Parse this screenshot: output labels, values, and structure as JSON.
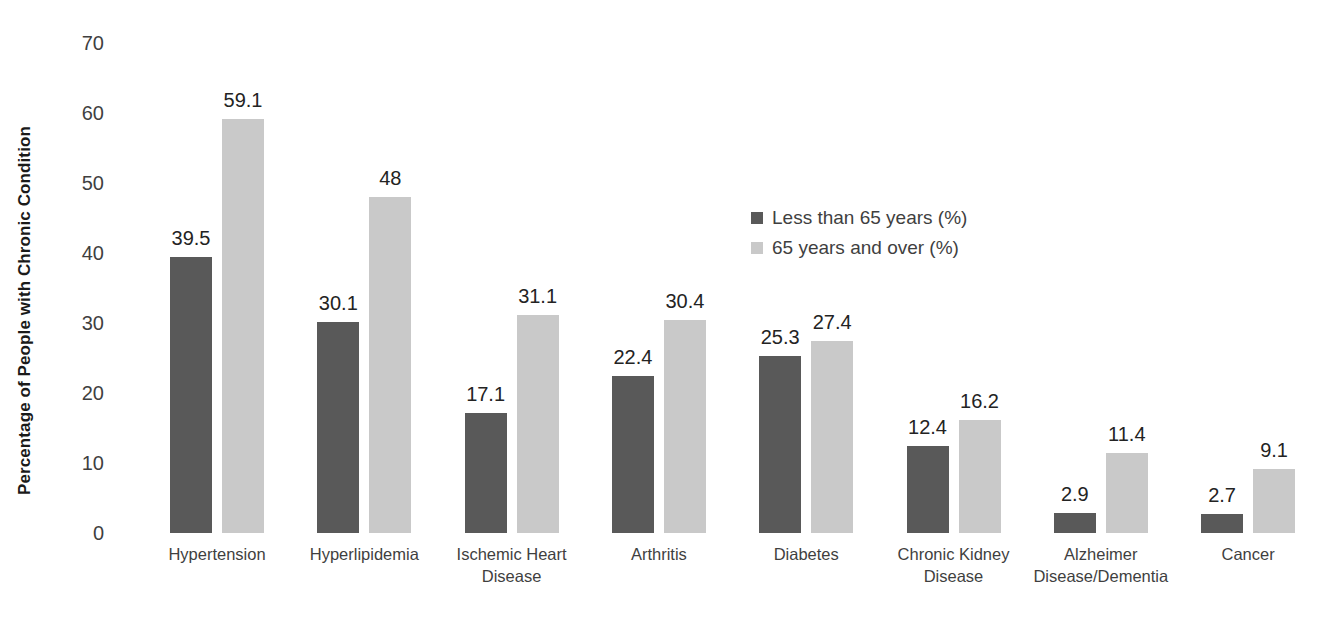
{
  "chart_data": {
    "type": "bar",
    "title": "",
    "subtitle": "",
    "xlabel": "",
    "ylabel": "Percentage of People with Chronic Condition",
    "ylim": [
      0,
      70
    ],
    "ytick_step": 10,
    "yticks": [
      "70",
      "60",
      "50",
      "40",
      "30",
      "20",
      "10",
      "0"
    ],
    "grid": false,
    "legend_position": "center-right",
    "categories": [
      "Hypertension",
      "Hyperlipidemia",
      "Ischemic Heart Disease",
      "Arthritis",
      "Diabetes",
      "Chronic Kidney Disease",
      "Alzheimer Disease/Dementia",
      "Cancer"
    ],
    "category_lines": [
      [
        "Hypertension"
      ],
      [
        "Hyperlipidemia"
      ],
      [
        "Ischemic Heart",
        "Disease"
      ],
      [
        "Arthritis"
      ],
      [
        "Diabetes"
      ],
      [
        "Chronic Kidney",
        "Disease"
      ],
      [
        "Alzheimer",
        "Disease/Dementia"
      ],
      [
        "Cancer"
      ]
    ],
    "series": [
      {
        "name": "Less than 65 years (%)",
        "color": "#595959",
        "values": [
          39.5,
          30.1,
          17.1,
          22.4,
          25.3,
          12.4,
          2.9,
          2.7
        ],
        "labels": [
          "39.5",
          "30.1",
          "17.1",
          "22.4",
          "25.3",
          "12.4",
          "2.9",
          "2.7"
        ]
      },
      {
        "name": "65 years and over (%)",
        "color": "#c9c9c9",
        "values": [
          59.1,
          48,
          31.1,
          30.4,
          27.4,
          16.2,
          11.4,
          9.1
        ],
        "labels": [
          "59.1",
          "48",
          "31.1",
          "30.4",
          "27.4",
          "16.2",
          "11.4",
          "9.1"
        ]
      }
    ]
  },
  "legend": {
    "items": [
      {
        "label": "Less than 65 years (%)",
        "color": "#595959"
      },
      {
        "label": "65 years and over (%)",
        "color": "#c9c9c9"
      }
    ]
  },
  "colors": {
    "background": "#ffffff",
    "series_dark": "#595959",
    "series_light": "#c9c9c9",
    "tick_text": "#3f3f3f",
    "label_text": "#232323",
    "axis_title": "#1a1a1a"
  }
}
